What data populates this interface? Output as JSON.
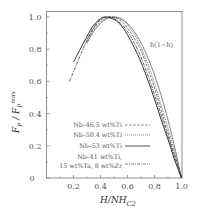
{
  "chart_data": {
    "type": "line",
    "title": "",
    "xlabel": "H/NH_C2",
    "xlabel_main": "H/NH",
    "xlabel_sub": "C2",
    "ylabel_main": "F",
    "ylabel_sub": "P",
    "ylabel_div": " / F",
    "ylabel_sup": "max",
    "ylabel_sub2": "P",
    "xlim": [
      0,
      1.0
    ],
    "ylim": [
      0,
      1.04
    ],
    "xticks": [
      0.2,
      0.4,
      0.6,
      0.8,
      1.0
    ],
    "xtick_labels": [
      "0.2",
      "0.4",
      "0.6",
      "0.8",
      "1.0"
    ],
    "yticks": [
      0,
      0.2,
      0.4,
      0.6,
      0.8,
      1.0
    ],
    "ytick_labels": [
      "0",
      "0.2",
      "0.4",
      "0.6",
      "0.8",
      "1.0"
    ],
    "grid": false,
    "legend_position": "lower-center",
    "annotation": "h(1−h)",
    "series": [
      {
        "name": "Nb–46.5 wt%Ti",
        "style": "dashed",
        "x": [
          0.3,
          0.35,
          0.4,
          0.45,
          0.48,
          0.52,
          0.56,
          0.6,
          0.65,
          0.7,
          0.75,
          0.8,
          0.85,
          0.9,
          0.95,
          1.0
        ],
        "y": [
          0.86,
          0.93,
          0.98,
          1.0,
          1.0,
          0.99,
          0.97,
          0.93,
          0.87,
          0.79,
          0.68,
          0.56,
          0.42,
          0.28,
          0.14,
          0.0
        ]
      },
      {
        "name": "Nb–50.4 wt%Ti",
        "style": "dotted",
        "x": [
          0.3,
          0.35,
          0.4,
          0.45,
          0.5,
          0.54,
          0.58,
          0.62,
          0.66,
          0.7,
          0.75,
          0.8,
          0.85,
          0.9,
          0.95,
          1.0
        ],
        "y": [
          0.84,
          0.92,
          0.97,
          0.995,
          1.0,
          0.99,
          0.97,
          0.93,
          0.88,
          0.81,
          0.71,
          0.59,
          0.45,
          0.31,
          0.16,
          0.0
        ]
      },
      {
        "name": "Nb–53 wt%Ti",
        "style": "solid",
        "x": [
          0.2,
          0.25,
          0.3,
          0.35,
          0.4,
          0.43,
          0.47,
          0.51,
          0.55,
          0.6,
          0.65,
          0.7,
          0.75,
          0.8,
          0.85,
          0.9,
          0.95,
          1.0
        ],
        "y": [
          0.72,
          0.8,
          0.88,
          0.95,
          0.99,
          1.0,
          0.995,
          0.98,
          0.95,
          0.89,
          0.81,
          0.72,
          0.61,
          0.49,
          0.36,
          0.24,
          0.11,
          0.0
        ]
      },
      {
        "name": "Nb–41 wt%Ti, 15 wt%Ta, 8 wt%Zr",
        "style": "dashdot",
        "x": [
          0.17,
          0.22,
          0.27,
          0.32,
          0.37,
          0.42,
          0.46,
          0.5,
          0.55,
          0.6,
          0.65,
          0.7,
          0.75,
          0.8,
          0.85,
          0.9,
          0.95,
          1.0
        ],
        "y": [
          0.6,
          0.7,
          0.8,
          0.89,
          0.96,
          0.995,
          1.0,
          0.99,
          0.96,
          0.91,
          0.84,
          0.75,
          0.64,
          0.52,
          0.39,
          0.26,
          0.13,
          0.0
        ]
      },
      {
        "name": "h(1−h)",
        "style": "solid-thin",
        "x": [
          0.3,
          0.35,
          0.4,
          0.45,
          0.5,
          0.55,
          0.6,
          0.65,
          0.7,
          0.75,
          0.8,
          0.85,
          0.9,
          0.95,
          1.0
        ],
        "y": [
          0.84,
          0.91,
          0.96,
          0.99,
          1.0,
          0.99,
          0.96,
          0.91,
          0.84,
          0.75,
          0.64,
          0.51,
          0.36,
          0.19,
          0.0
        ]
      }
    ],
    "legend": [
      {
        "label": "Nb–46.5 wt%Ti",
        "style": "dashed"
      },
      {
        "label": "Nb–50.4 wt%Ti",
        "style": "dotted"
      },
      {
        "label": "Nb–53 wt%Ti",
        "style": "solid"
      },
      {
        "label_line1": "Nb–41 wt%Ti,",
        "label_line2": "15 wt%Ta, 8 wt%Zr",
        "style": "dashdot"
      }
    ]
  }
}
